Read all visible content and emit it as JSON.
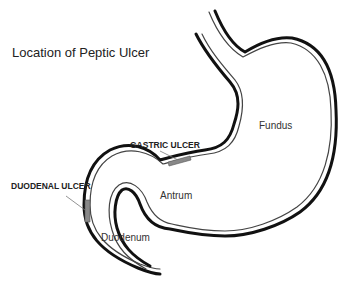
{
  "title": "Location of Peptic Ulcer",
  "labels": {
    "gastric_ulcer": "GASTRIC ULCER",
    "duodenal_ulcer": "DUODENAL ULCER",
    "fundus": "Fundus",
    "antrum": "Antrum",
    "duodenum": "Duodenum"
  },
  "colors": {
    "outline": "#111111",
    "inner_line": "#555555",
    "ulcer_fill": "#888888",
    "pointer": "#777777"
  }
}
